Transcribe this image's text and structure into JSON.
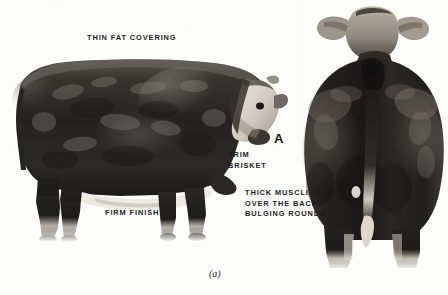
{
  "figure": {
    "caption": "(a)",
    "panel_letter": "A",
    "background_color": "#fdfdfc",
    "ink_color": "#1c1c1c"
  },
  "annotations": [
    {
      "id": "thin-fat-covering",
      "text": "THIN FAT COVERING",
      "lines": [
        "THIN FAT COVERING"
      ],
      "points_to": "topline / back of steer"
    },
    {
      "id": "trim-brisket",
      "text": "TRIM\nBRISKET",
      "lines": [
        "TRIM",
        "BRISKET"
      ],
      "points_to": "brisket, front of chest"
    },
    {
      "id": "firm-finish",
      "text": "FIRM FINISH",
      "lines": [
        "FIRM FINISH"
      ],
      "points_to": "lower barrel / flank"
    },
    {
      "id": "thick-muscling",
      "text": "THICK MUSCLING\nOVER THE BACK,\nBULGING ROUNDS",
      "lines": [
        "THICK MUSCLING",
        "OVER THE BACK,",
        "BULGING ROUNDS"
      ],
      "points_to": "rear view, back and rounds"
    }
  ],
  "photos": [
    {
      "id": "side-view",
      "view": "side profile, facing right",
      "breed_markings": "dark body with white face, white underline and white socks"
    },
    {
      "id": "rear-view",
      "view": "rear, standing square",
      "breed_markings": "dark rounded rump, white tail switch"
    }
  ]
}
